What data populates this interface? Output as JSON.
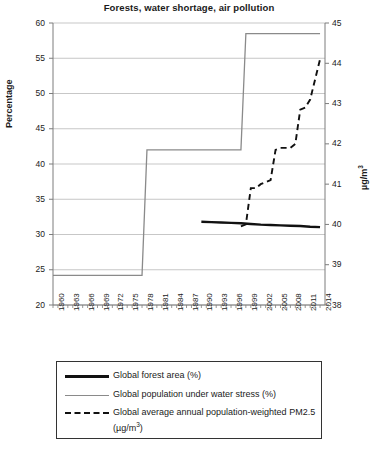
{
  "chart_data": {
    "type": "line",
    "title": "Forests, water shortage, air pollution",
    "xlabel": "",
    "ylabel": "Percentage",
    "y2label": "µg/m³",
    "xlim": [
      1960,
      2015
    ],
    "ylim": [
      20,
      60
    ],
    "y2lim": [
      38,
      45
    ],
    "yticks": [
      20,
      25,
      30,
      35,
      40,
      45,
      50,
      55,
      60
    ],
    "y2ticks": [
      38,
      39,
      40,
      41,
      42,
      43,
      44,
      45
    ],
    "xticks": [
      1960,
      1963,
      1966,
      1969,
      1972,
      1975,
      1978,
      1981,
      1984,
      1987,
      1990,
      1993,
      1996,
      1999,
      2002,
      2005,
      2008,
      2011,
      2014
    ],
    "grid": "horizontal",
    "legend_position": "below-plot",
    "series": [
      {
        "name": "Global forest area (%)",
        "axis": "left",
        "style": "solid-thick",
        "color": "#111111",
        "x": [
          1990,
          1992,
          1994,
          1996,
          1998,
          2000,
          2002,
          2004,
          2006,
          2008,
          2010,
          2012,
          2014
        ],
        "values": [
          31.8,
          31.75,
          31.7,
          31.65,
          31.6,
          31.5,
          31.4,
          31.35,
          31.3,
          31.25,
          31.2,
          31.1,
          31.05
        ]
      },
      {
        "name": "Global population under water stress (%)",
        "axis": "left",
        "style": "solid-thin",
        "color": "#8a8a8a",
        "x": [
          1960,
          1978,
          1979,
          1998,
          1999,
          2014
        ],
        "values": [
          24.2,
          24.2,
          42.0,
          42.0,
          58.5,
          58.5
        ]
      },
      {
        "name": "Global average annual population-weighted PM2.5 (µg/m³)",
        "axis": "right",
        "style": "dashed",
        "color": "#111111",
        "x": [
          1998,
          1999,
          2000,
          2001,
          2002,
          2003,
          2004,
          2005,
          2006,
          2007,
          2008,
          2009,
          2010,
          2011,
          2012,
          2013,
          2014
        ],
        "values": [
          39.95,
          40.0,
          40.9,
          40.9,
          41.0,
          41.05,
          41.1,
          41.85,
          41.9,
          41.9,
          41.9,
          42.0,
          42.85,
          42.9,
          43.1,
          43.6,
          44.1
        ]
      }
    ]
  },
  "legend": {
    "entries": [
      {
        "label": "Global forest area (%)",
        "style": "solid-thick"
      },
      {
        "label": "Global population under water stress (%)",
        "style": "solid-thin"
      },
      {
        "label": "Global average annual population-weighted PM2.5 (µg/m",
        "style": "dashed"
      }
    ],
    "pm_sup": "3",
    "pm_tail": ")"
  },
  "axes": {
    "left_title": "Percentage",
    "right_title_base": "µg/m",
    "right_title_sup": "3"
  }
}
